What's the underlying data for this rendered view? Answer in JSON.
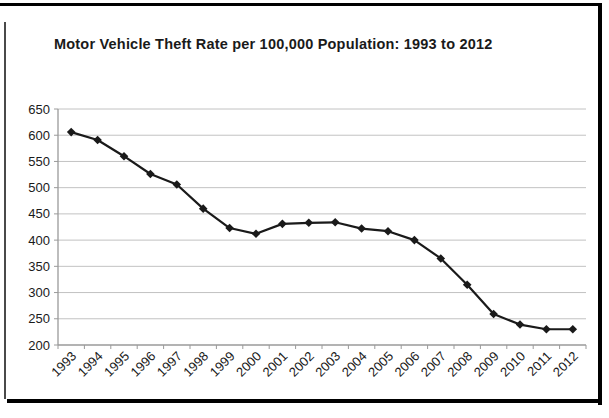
{
  "window": {
    "background": "#ffffff"
  },
  "chart_data": {
    "type": "line",
    "title": "Motor Vehicle Theft Rate per 100,000 Population: 1993 to 2012",
    "categories": [
      "1993",
      "1994",
      "1995",
      "1996",
      "1997",
      "1998",
      "1999",
      "2000",
      "2001",
      "2002",
      "2003",
      "2004",
      "2005",
      "2006",
      "2007",
      "2008",
      "2009",
      "2010",
      "2011",
      "2012"
    ],
    "values": [
      606,
      591,
      560,
      526,
      506,
      460,
      423,
      412,
      431,
      433,
      434,
      422,
      417,
      400,
      365,
      315,
      259,
      239,
      230,
      230
    ],
    "xlabel": "",
    "ylabel": "",
    "ylim": [
      200,
      650
    ],
    "y_ticks": [
      200,
      250,
      300,
      350,
      400,
      450,
      500,
      550,
      600,
      650
    ],
    "grid": "horizontal",
    "legend": "none",
    "marker": "diamond",
    "x_tick_label_rotation_deg": -45,
    "colors": {
      "line": "#1a1a1a",
      "marker": "#1a1a1a",
      "gridline": "#c2c2c2",
      "axis": "#9a9a9a",
      "text": "#1a1a1a",
      "frame": "#000000"
    }
  }
}
